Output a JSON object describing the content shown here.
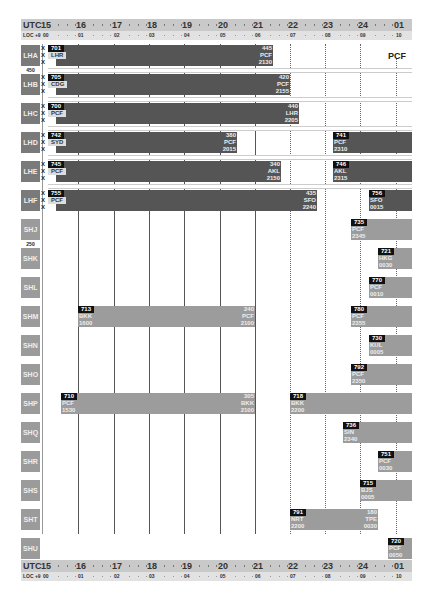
{
  "axis": {
    "utc_label": "UTC",
    "loc_label": "LOC +9",
    "hours": [
      {
        "utc": "15",
        "loc": "00",
        "x": 43
      },
      {
        "utc": "16",
        "loc": "01",
        "x": 78
      },
      {
        "utc": "17",
        "loc": "02",
        "x": 114
      },
      {
        "utc": "18",
        "loc": "03",
        "x": 149
      },
      {
        "utc": "19",
        "loc": "04",
        "x": 184
      },
      {
        "utc": "20",
        "loc": "05",
        "x": 220
      },
      {
        "utc": "21",
        "loc": "06",
        "x": 255
      },
      {
        "utc": "22",
        "loc": "07",
        "x": 290
      },
      {
        "utc": "23",
        "loc": "08",
        "x": 325
      },
      {
        "utc": "24",
        "loc": "09",
        "x": 360
      },
      {
        "utc": "01",
        "loc": "10",
        "x": 396
      }
    ]
  },
  "station_label": "PCF",
  "fleet_separators": {
    "lh_seats": "450",
    "sh_seats": "250"
  },
  "aircraft": [
    {
      "reg": "LHA",
      "type": "long",
      "top": 45,
      "flights": [
        {
          "fn": "701",
          "from": "LHR",
          "to": "PCF",
          "arr_fn": "445",
          "arr": "2130",
          "x1": 48,
          "x2": 273,
          "style": "dark",
          "x_marks": true
        }
      ]
    },
    {
      "reg": "LHB",
      "type": "long",
      "top": 74,
      "flights": [
        {
          "fn": "705",
          "from": "CDG",
          "to": "PCF",
          "arr_fn": "420",
          "arr": "2155",
          "x1": 48,
          "x2": 290,
          "style": "dark",
          "x_marks": true
        }
      ]
    },
    {
      "reg": "LHC",
      "type": "long",
      "top": 103,
      "flights": [
        {
          "fn": "700",
          "from": "PCF",
          "to": "LHR",
          "arr_fn": "440",
          "arr": "2205",
          "x1": 48,
          "x2": 299,
          "style": "dark",
          "x_marks": true
        }
      ]
    },
    {
      "reg": "LHD",
      "type": "long",
      "top": 132,
      "flights": [
        {
          "fn": "742",
          "from": "SYD",
          "to": "PCF",
          "arr_fn": "380",
          "arr": "2015",
          "x1": 48,
          "x2": 237,
          "style": "dark",
          "x_marks": true
        },
        {
          "fn": "741",
          "from": "PCF",
          "dep": "2310",
          "x1": 333,
          "x2": 412,
          "style": "dark"
        }
      ]
    },
    {
      "reg": "LHE",
      "type": "long",
      "top": 161,
      "flights": [
        {
          "fn": "745",
          "from": "PCF",
          "to": "AKL",
          "arr_fn": "340",
          "arr": "2150",
          "x1": 48,
          "x2": 281,
          "style": "dark",
          "x_marks": true
        },
        {
          "fn": "746",
          "from": "AKL",
          "dep": "2315",
          "x1": 333,
          "x2": 412,
          "style": "dark"
        }
      ]
    },
    {
      "reg": "LHF",
      "type": "long",
      "top": 190,
      "flights": [
        {
          "fn": "755",
          "from": "PCF",
          "to": "SFO",
          "arr_fn": "435",
          "arr": "2240",
          "x1": 48,
          "x2": 317,
          "style": "dark",
          "x_marks": true
        },
        {
          "fn": "756",
          "from": "SFO",
          "dep": "0015",
          "x1": 369,
          "x2": 412,
          "style": "dark"
        }
      ]
    },
    {
      "reg": "SHJ",
      "type": "short",
      "top": 219,
      "flights": [
        {
          "fn": "735",
          "from": "PCF",
          "dep": "2345",
          "x1": 351,
          "x2": 412,
          "style": "light"
        }
      ]
    },
    {
      "reg": "SHK",
      "type": "short",
      "top": 248,
      "flights": [
        {
          "fn": "721",
          "from": "HKG",
          "dep": "0030",
          "x1": 378,
          "x2": 412,
          "style": "light"
        }
      ]
    },
    {
      "reg": "SHL",
      "type": "short",
      "top": 277,
      "flights": [
        {
          "fn": "770",
          "from": "PCF",
          "dep": "0010",
          "x1": 369,
          "x2": 412,
          "style": "light"
        }
      ]
    },
    {
      "reg": "SHM",
      "type": "short",
      "top": 306,
      "flights": [
        {
          "fn": "713",
          "from": "BKK",
          "to": "PCF",
          "arr_fn": "240",
          "dep": "1600",
          "arr": "2100",
          "x1": 78,
          "x2": 255,
          "style": "light"
        },
        {
          "fn": "780",
          "from": "PCF",
          "dep": "2355",
          "x1": 351,
          "x2": 412,
          "style": "light"
        }
      ]
    },
    {
      "reg": "SHN",
      "type": "short",
      "top": 335,
      "flights": [
        {
          "fn": "730",
          "from": "KUL",
          "dep": "0005",
          "x1": 369,
          "x2": 412,
          "style": "light"
        }
      ]
    },
    {
      "reg": "SHO",
      "type": "short",
      "top": 364,
      "flights": [
        {
          "fn": "792",
          "from": "PCF",
          "dep": "2350",
          "x1": 351,
          "x2": 412,
          "style": "light"
        }
      ]
    },
    {
      "reg": "SHP",
      "type": "short",
      "top": 393,
      "flights": [
        {
          "fn": "710",
          "from": "PCF",
          "to": "BKK",
          "arr_fn": "305",
          "dep": "1530",
          "arr": "2100",
          "x1": 61,
          "x2": 255,
          "style": "light"
        },
        {
          "fn": "718",
          "from": "BKK",
          "dep": "2200",
          "x1": 290,
          "x2": 412,
          "style": "light"
        }
      ]
    },
    {
      "reg": "SHQ",
      "type": "short",
      "top": 422,
      "flights": [
        {
          "fn": "736",
          "from": "SIN",
          "dep": "2340",
          "x1": 343,
          "x2": 412,
          "style": "light"
        }
      ]
    },
    {
      "reg": "SHR",
      "type": "short",
      "top": 451,
      "flights": [
        {
          "fn": "751",
          "from": "PCF",
          "dep": "0030",
          "x1": 378,
          "x2": 412,
          "style": "light"
        }
      ]
    },
    {
      "reg": "SHS",
      "type": "short",
      "top": 480,
      "flights": [
        {
          "fn": "715",
          "from": "BJS",
          "dep": "0005",
          "x1": 360,
          "x2": 412,
          "style": "light"
        }
      ]
    },
    {
      "reg": "SHT",
      "type": "short",
      "top": 509,
      "flights": [
        {
          "fn": "791",
          "from": "NRT",
          "to": "TPE",
          "arr_fn": "180",
          "dep": "2200",
          "arr": "0030",
          "x1": 290,
          "x2": 378,
          "style": "light"
        }
      ]
    },
    {
      "reg": "SHU",
      "type": "short",
      "top": 538,
      "flights": [
        {
          "fn": "720",
          "from": "PCF",
          "dep": "0050",
          "x1": 388,
          "x2": 412,
          "style": "light"
        }
      ]
    }
  ]
}
